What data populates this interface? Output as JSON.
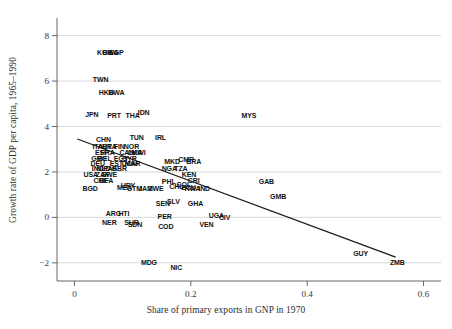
{
  "chart_data": {
    "type": "scatter",
    "title": "",
    "xlabel": "Share of primary exports in GNP in 1970",
    "ylabel": "Growth rate of GDP per capita, 1965–1990",
    "xlim": [
      -0.03,
      0.63
    ],
    "ylim": [
      -2.8,
      8.6
    ],
    "xticks": [
      "0",
      "0.2",
      "0.4",
      "0.6"
    ],
    "xtick_values": [
      0,
      0.2,
      0.4,
      0.6
    ],
    "yticks": [
      "8",
      "6",
      "4",
      "2",
      "0",
      "−2"
    ],
    "ytick_values": [
      8,
      6,
      4,
      2,
      0,
      -2
    ],
    "grid": "horizontal",
    "legend": "none",
    "marker_style": "text-label-only",
    "trendline": {
      "name": "OLS fit",
      "x0": 0.005,
      "y0": 3.45,
      "x1": 0.552,
      "y1": -1.75,
      "color": "#1a1a1a"
    },
    "points": [
      {
        "label": "KOR",
        "x": 0.052,
        "y": 7.3
      },
      {
        "label": "BWA",
        "x": 0.062,
        "y": 7.3
      },
      {
        "label": "SGP",
        "x": 0.072,
        "y": 7.3
      },
      {
        "label": "TWN",
        "x": 0.045,
        "y": 6.1
      },
      {
        "label": "HKG",
        "x": 0.055,
        "y": 5.5
      },
      {
        "label": "BWA",
        "x": 0.072,
        "y": 5.5
      },
      {
        "label": "JPN",
        "x": 0.03,
        "y": 4.55
      },
      {
        "label": "PRT",
        "x": 0.068,
        "y": 4.5
      },
      {
        "label": "THA",
        "x": 0.1,
        "y": 4.5
      },
      {
        "label": "IDN",
        "x": 0.119,
        "y": 4.65
      },
      {
        "label": "CHN",
        "x": 0.05,
        "y": 3.45
      },
      {
        "label": "TUN",
        "x": 0.107,
        "y": 3.55
      },
      {
        "label": "IRL",
        "x": 0.148,
        "y": 3.55
      },
      {
        "label": "ITA",
        "x": 0.04,
        "y": 3.15
      },
      {
        "label": "AUT",
        "x": 0.052,
        "y": 3.15
      },
      {
        "label": "BRA",
        "x": 0.06,
        "y": 3.15
      },
      {
        "label": "FIN",
        "x": 0.077,
        "y": 3.15
      },
      {
        "label": "NOR",
        "x": 0.098,
        "y": 3.15
      },
      {
        "label": "ESP",
        "x": 0.047,
        "y": 2.9
      },
      {
        "label": "FRA",
        "x": 0.057,
        "y": 2.9
      },
      {
        "label": "CAN",
        "x": 0.09,
        "y": 2.9
      },
      {
        "label": "LKA",
        "x": 0.104,
        "y": 2.9
      },
      {
        "label": "MWI",
        "x": 0.11,
        "y": 2.9
      },
      {
        "label": "GRC",
        "x": 0.042,
        "y": 2.62
      },
      {
        "label": "BEL",
        "x": 0.052,
        "y": 2.62
      },
      {
        "label": "EGY",
        "x": 0.08,
        "y": 2.62
      },
      {
        "label": "SYR",
        "x": 0.095,
        "y": 2.62
      },
      {
        "label": "MYS",
        "x": 0.3,
        "y": 4.5
      },
      {
        "label": "DEU",
        "x": 0.04,
        "y": 2.4
      },
      {
        "label": "EST",
        "x": 0.072,
        "y": 2.4
      },
      {
        "label": "DOM",
        "x": 0.095,
        "y": 2.4
      },
      {
        "label": "MAR",
        "x": 0.1,
        "y": 2.4
      },
      {
        "label": "MKD",
        "x": 0.168,
        "y": 2.5
      },
      {
        "label": "CMR",
        "x": 0.192,
        "y": 2.55
      },
      {
        "label": "BRA",
        "x": 0.205,
        "y": 2.5
      },
      {
        "label": "IND",
        "x": 0.04,
        "y": 2.18
      },
      {
        "label": "NLD",
        "x": 0.05,
        "y": 2.18
      },
      {
        "label": "PAK",
        "x": 0.062,
        "y": 2.18
      },
      {
        "label": "GBR",
        "x": 0.077,
        "y": 2.18
      },
      {
        "label": "NGA",
        "x": 0.163,
        "y": 2.18
      },
      {
        "label": "TZA",
        "x": 0.183,
        "y": 2.18
      },
      {
        "label": "USA",
        "x": 0.028,
        "y": 1.92
      },
      {
        "label": "SWE",
        "x": 0.06,
        "y": 1.92
      },
      {
        "label": "ZAF",
        "x": 0.048,
        "y": 1.92
      },
      {
        "label": "KEN",
        "x": 0.197,
        "y": 1.9
      },
      {
        "label": "CHE",
        "x": 0.045,
        "y": 1.65
      },
      {
        "label": "BFA",
        "x": 0.055,
        "y": 1.65
      },
      {
        "label": "PHL",
        "x": 0.162,
        "y": 1.62
      },
      {
        "label": "CRI",
        "x": 0.205,
        "y": 1.65
      },
      {
        "label": "BGD",
        "x": 0.027,
        "y": 1.28
      },
      {
        "label": "MEX",
        "x": 0.086,
        "y": 1.32
      },
      {
        "label": "URY",
        "x": 0.092,
        "y": 1.42
      },
      {
        "label": "GTM",
        "x": 0.103,
        "y": 1.28
      },
      {
        "label": "JAM",
        "x": 0.122,
        "y": 1.28
      },
      {
        "label": "ZWE",
        "x": 0.14,
        "y": 1.28
      },
      {
        "label": "CHL",
        "x": 0.175,
        "y": 1.4
      },
      {
        "label": "COL",
        "x": 0.188,
        "y": 1.48
      },
      {
        "label": "ECU",
        "x": 0.196,
        "y": 1.33
      },
      {
        "label": "RWA",
        "x": 0.203,
        "y": 1.28
      },
      {
        "label": "IND",
        "x": 0.223,
        "y": 1.28
      },
      {
        "label": "GAB",
        "x": 0.33,
        "y": 1.62
      },
      {
        "label": "GMB",
        "x": 0.35,
        "y": 0.92
      },
      {
        "label": "SEN",
        "x": 0.152,
        "y": 0.62
      },
      {
        "label": "SLV",
        "x": 0.17,
        "y": 0.72
      },
      {
        "label": "GHA",
        "x": 0.208,
        "y": 0.62
      },
      {
        "label": "ARG",
        "x": 0.067,
        "y": 0.2
      },
      {
        "label": "HTI",
        "x": 0.085,
        "y": 0.2
      },
      {
        "label": "PER",
        "x": 0.155,
        "y": 0.05
      },
      {
        "label": "UGA",
        "x": 0.244,
        "y": 0.12
      },
      {
        "label": "CIV",
        "x": 0.258,
        "y": 0.03
      },
      {
        "label": "NER",
        "x": 0.06,
        "y": -0.2
      },
      {
        "label": "SUR",
        "x": 0.098,
        "y": -0.22
      },
      {
        "label": "SDN",
        "x": 0.104,
        "y": -0.28
      },
      {
        "label": "COD",
        "x": 0.157,
        "y": -0.4
      },
      {
        "label": "VEN",
        "x": 0.227,
        "y": -0.28
      },
      {
        "label": "MDG",
        "x": 0.128,
        "y": -1.95
      },
      {
        "label": "NIC",
        "x": 0.175,
        "y": -2.2
      },
      {
        "label": "GUY",
        "x": 0.492,
        "y": -1.55
      },
      {
        "label": "ZMB",
        "x": 0.555,
        "y": -1.98
      }
    ]
  },
  "axes": {
    "x_axis_name": "x-axis",
    "y_axis_name": "y-axis"
  }
}
